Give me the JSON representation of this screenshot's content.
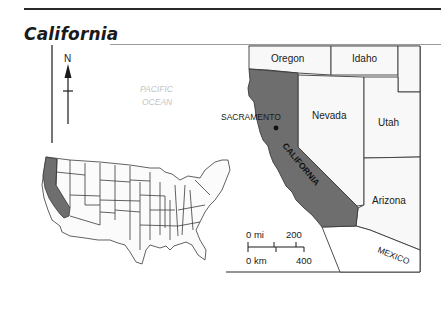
{
  "title": "California",
  "compass": {
    "label": "N"
  },
  "ocean_label": {
    "line1": "PACIFIC",
    "line2": "OCEAN"
  },
  "capital": {
    "name": "SACRAMENTO"
  },
  "highlighted_state": {
    "name": "CALIFORNIA",
    "fill": "#6e6e6e"
  },
  "neighbors": {
    "oregon": "Oregon",
    "idaho": "Idaho",
    "nevada": "Nevada",
    "utah": "Utah",
    "arizona": "Arizona",
    "mexico": "MEXICO"
  },
  "scale_bar": {
    "mi_label": "0 mi",
    "mi_value": "200",
    "km_label": "0 km",
    "km_value": "400"
  },
  "colors": {
    "highlight": "#6e6e6e",
    "land": "#f7f7f7",
    "border": "#3a3a3a",
    "ocean_text": "#c4c4c4"
  }
}
